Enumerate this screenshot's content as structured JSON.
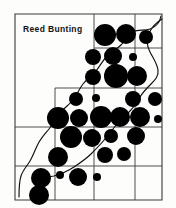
{
  "figure": {
    "title": "Reed Bunting",
    "kind": "distribution-atlas-map",
    "background_color": "#fdfdfc",
    "ink_color": "#000000",
    "grid_color": "#3a3a3a",
    "dot_color": "#000000",
    "coastline_color": "#1a1a1a"
  },
  "chart_data": {
    "type": "scatter",
    "title": "Reed Bunting",
    "xlabel": "",
    "ylabel": "",
    "grid": true,
    "legend_position": "none",
    "xlim": [
      0,
      176
    ],
    "ylim": [
      0,
      208
    ],
    "grid_lines": {
      "vertical": [
        15,
        55,
        94,
        135,
        162
      ],
      "horizontal": [
        14,
        48,
        88,
        127,
        166,
        200
      ]
    },
    "grid_outline_path": "M15,14 L162,14 L162,200 L15,200 Z",
    "grid_steps": [
      {
        "name": "upper-left-block",
        "x0": 15,
        "y0": 14,
        "x1": 94,
        "y1": 48
      },
      {
        "name": "mid-left-step",
        "x0": 15,
        "y0": 48,
        "x1": 55,
        "y1": 88
      },
      {
        "name": "lower-left-step",
        "x0": 15,
        "y0": 88,
        "x1": 15,
        "y1": 127
      }
    ],
    "dots": [
      {
        "cx": 105,
        "cy": 35,
        "r": 11
      },
      {
        "cx": 126,
        "cy": 34,
        "r": 10
      },
      {
        "cx": 146,
        "cy": 37,
        "r": 7
      },
      {
        "cx": 93,
        "cy": 57,
        "r": 8
      },
      {
        "cx": 113,
        "cy": 56,
        "r": 9
      },
      {
        "cx": 133,
        "cy": 57,
        "r": 4
      },
      {
        "cx": 93,
        "cy": 77,
        "r": 8
      },
      {
        "cx": 116,
        "cy": 76,
        "r": 12
      },
      {
        "cx": 137,
        "cy": 76,
        "r": 10
      },
      {
        "cx": 76,
        "cy": 99,
        "r": 7
      },
      {
        "cx": 96,
        "cy": 98,
        "r": 4
      },
      {
        "cx": 133,
        "cy": 99,
        "r": 8
      },
      {
        "cx": 155,
        "cy": 99,
        "r": 7
      },
      {
        "cx": 58,
        "cy": 118,
        "r": 11
      },
      {
        "cx": 79,
        "cy": 118,
        "r": 9
      },
      {
        "cx": 101,
        "cy": 117,
        "r": 11
      },
      {
        "cx": 120,
        "cy": 117,
        "r": 10
      },
      {
        "cx": 140,
        "cy": 117,
        "r": 10
      },
      {
        "cx": 158,
        "cy": 119,
        "r": 4
      },
      {
        "cx": 71,
        "cy": 137,
        "r": 11
      },
      {
        "cx": 92,
        "cy": 138,
        "r": 9
      },
      {
        "cx": 111,
        "cy": 136,
        "r": 7
      },
      {
        "cx": 136,
        "cy": 136,
        "r": 9
      },
      {
        "cx": 58,
        "cy": 157,
        "r": 10
      },
      {
        "cx": 105,
        "cy": 155,
        "r": 8
      },
      {
        "cx": 124,
        "cy": 154,
        "r": 7
      },
      {
        "cx": 41,
        "cy": 178,
        "r": 10
      },
      {
        "cx": 60,
        "cy": 175,
        "r": 4
      },
      {
        "cx": 78,
        "cy": 177,
        "r": 9
      },
      {
        "cx": 97,
        "cy": 177,
        "r": 4
      },
      {
        "cx": 39,
        "cy": 195,
        "r": 10
      }
    ],
    "coastline_path": "M160,18 L158,26 L152,30 L144,31 L137,29 L130,31 L124,36 L118,41 L110,44 L103,48 L96,52 L90,57 L84,62 L80,68 L77,74 L74,80 L70,86 L66,92 L62,97 L58,103 L54,110 L50,117 L46,124 L42,131 L39,139 L36,146 L32,153 L28,160 L24,166 L21,172 L19,178 L18,186 L18,194",
    "river_path": "M162,20 L155,24 L150,32 L146,40 L148,50 L152,58 L156,66 L158,74 L154,80 L150,86 L146,92 L142,98 L138,104 L133,110 L128,116 L122,122 L116,128 L110,134 L104,140 L98,147 L92,154 L85,160 L78,166 L70,171 L62,175 L53,177 L44,178"
  }
}
